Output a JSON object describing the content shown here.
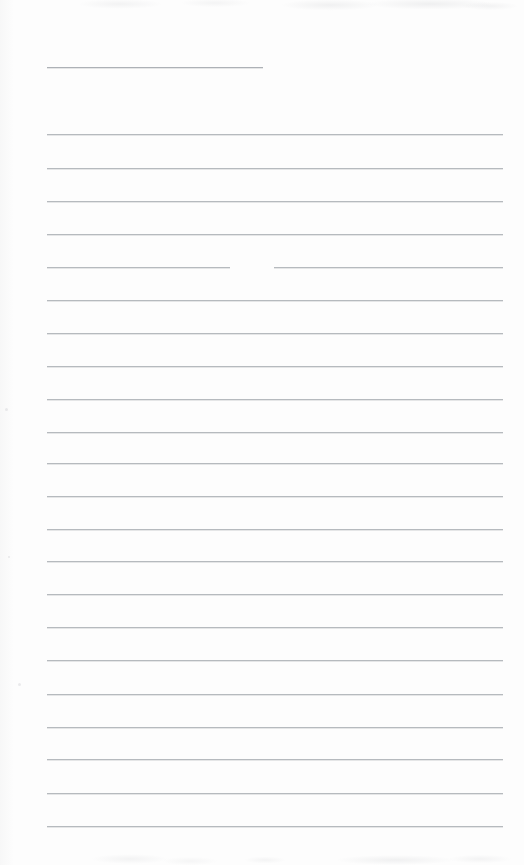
{
  "document": {
    "kind": "scanned-blank-lined-page",
    "width": 524,
    "height": 865,
    "paper_color": "#fdfdfd",
    "rule_color": "#b6babe",
    "text_content": "",
    "note": "Blank ruled notepad page; no written or printed text is present."
  },
  "layout": {
    "rule_left_x": 47,
    "rule_right_x": 503,
    "rule_spacing_px": 33,
    "rule_count": 23
  },
  "rules": [
    {
      "id": "header-rule",
      "y": 67,
      "x1": 47,
      "x2": 263,
      "full_width": false,
      "broken": false
    },
    {
      "id": "rule-01",
      "y": 134,
      "x1": 47,
      "x2": 503,
      "full_width": true,
      "broken": false
    },
    {
      "id": "rule-02",
      "y": 168,
      "x1": 47,
      "x2": 503,
      "full_width": true,
      "broken": false
    },
    {
      "id": "rule-03",
      "y": 201,
      "x1": 47,
      "x2": 503,
      "full_width": true,
      "broken": false
    },
    {
      "id": "rule-04",
      "y": 234,
      "x1": 47,
      "x2": 503,
      "full_width": true,
      "broken": false
    },
    {
      "id": "rule-05",
      "y": 267,
      "x1": 47,
      "x2": 503,
      "full_width": true,
      "broken": true,
      "gap_x1": 230,
      "gap_x2": 274
    },
    {
      "id": "rule-06",
      "y": 300,
      "x1": 47,
      "x2": 503,
      "full_width": true,
      "broken": false
    },
    {
      "id": "rule-07",
      "y": 333,
      "x1": 47,
      "x2": 503,
      "full_width": true,
      "broken": false
    },
    {
      "id": "rule-08",
      "y": 366,
      "x1": 47,
      "x2": 503,
      "full_width": true,
      "broken": false
    },
    {
      "id": "rule-09",
      "y": 399,
      "x1": 47,
      "x2": 503,
      "full_width": true,
      "broken": false
    },
    {
      "id": "rule-10",
      "y": 432,
      "x1": 47,
      "x2": 503,
      "full_width": true,
      "broken": false
    },
    {
      "id": "rule-11",
      "y": 463,
      "x1": 47,
      "x2": 503,
      "full_width": true,
      "broken": false
    },
    {
      "id": "rule-12",
      "y": 496,
      "x1": 47,
      "x2": 503,
      "full_width": true,
      "broken": false
    },
    {
      "id": "rule-13",
      "y": 529,
      "x1": 47,
      "x2": 503,
      "full_width": true,
      "broken": false
    },
    {
      "id": "rule-14",
      "y": 561,
      "x1": 47,
      "x2": 503,
      "full_width": true,
      "broken": false
    },
    {
      "id": "rule-15",
      "y": 594,
      "x1": 47,
      "x2": 503,
      "full_width": true,
      "broken": false
    },
    {
      "id": "rule-16",
      "y": 627,
      "x1": 47,
      "x2": 503,
      "full_width": true,
      "broken": false
    },
    {
      "id": "rule-17",
      "y": 660,
      "x1": 47,
      "x2": 503,
      "full_width": true,
      "broken": false
    },
    {
      "id": "rule-18",
      "y": 694,
      "x1": 47,
      "x2": 503,
      "full_width": true,
      "broken": false
    },
    {
      "id": "rule-19",
      "y": 727,
      "x1": 47,
      "x2": 503,
      "full_width": true,
      "broken": false
    },
    {
      "id": "rule-20",
      "y": 759,
      "x1": 47,
      "x2": 503,
      "full_width": true,
      "broken": false
    },
    {
      "id": "rule-21",
      "y": 793,
      "x1": 47,
      "x2": 503,
      "full_width": true,
      "broken": false
    },
    {
      "id": "rule-22",
      "y": 826,
      "x1": 47,
      "x2": 503,
      "full_width": true,
      "broken": false
    }
  ],
  "specks": [
    {
      "x": 5,
      "y": 408,
      "size": 3
    },
    {
      "x": 18,
      "y": 683,
      "size": 3
    },
    {
      "x": 8,
      "y": 556,
      "size": 2
    }
  ]
}
